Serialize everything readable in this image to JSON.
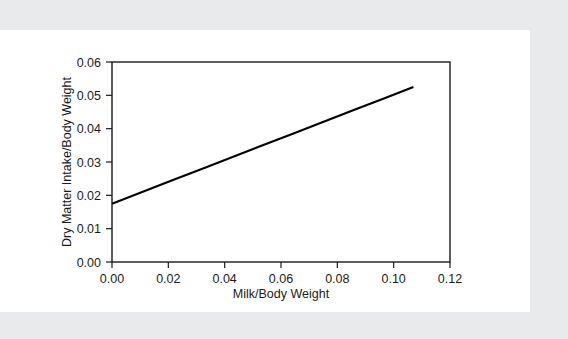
{
  "chart_data": {
    "type": "line",
    "title": "",
    "xlabel": "Milk/Body Weight",
    "ylabel": "Dry Matter Intake/Body Weight",
    "xlim": [
      0.0,
      0.12
    ],
    "ylim": [
      0.0,
      0.06
    ],
    "xticks": [
      0.0,
      0.02,
      0.04,
      0.06,
      0.08,
      0.1,
      0.12
    ],
    "yticks": [
      0.0,
      0.01,
      0.02,
      0.03,
      0.04,
      0.05,
      0.06
    ],
    "xtick_labels": [
      "0.00",
      "0.02",
      "0.04",
      "0.06",
      "0.08",
      "0.10",
      "0.12"
    ],
    "ytick_labels": [
      "0.00",
      "0.01",
      "0.02",
      "0.03",
      "0.04",
      "0.05",
      "0.06"
    ],
    "grid": false,
    "legend": false,
    "series": [
      {
        "name": "Dry Matter Intake/Body Weight vs Milk/Body Weight",
        "color": "#000000",
        "x": [
          0.0,
          0.0107,
          0.0214,
          0.0321,
          0.0428,
          0.0535,
          0.0642,
          0.0749,
          0.0856,
          0.0963,
          0.107
        ],
        "y": [
          0.0175,
          0.021,
          0.0245,
          0.028,
          0.0315,
          0.035,
          0.0385,
          0.042,
          0.0455,
          0.049,
          0.0525
        ]
      }
    ],
    "line_endpoints": {
      "start": [
        0.0,
        0.0175
      ],
      "end": [
        0.107,
        0.0525
      ]
    }
  },
  "figure": {
    "background_color": "#ffffff",
    "page_background_color": "#e9eaec",
    "axis_color": "#1b1b1b"
  }
}
